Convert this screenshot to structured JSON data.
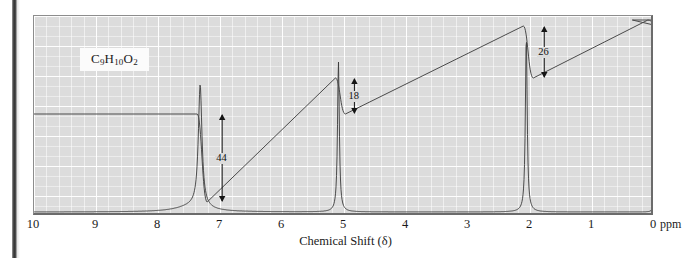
{
  "figure": {
    "formula": "C9H10O2",
    "formula_parts": [
      {
        "t": "C",
        "sub": false
      },
      {
        "t": "9",
        "sub": true
      },
      {
        "t": "H",
        "sub": false
      },
      {
        "t": "10",
        "sub": true
      },
      {
        "t": "O",
        "sub": false
      },
      {
        "t": "2",
        "sub": true
      }
    ],
    "axis_title": "Chemical Shift (δ)",
    "axis_unit": "ppm"
  },
  "chart_data": {
    "type": "line",
    "title": "",
    "subtitle": "",
    "xlabel": "Chemical Shift (δ)",
    "ylabel": "",
    "xlim": [
      10,
      0
    ],
    "xlim_note": "axis decreases left to right",
    "ylim": [
      0,
      100
    ],
    "grid": true,
    "legend": "none",
    "tick_labels": [
      "10",
      "9",
      "8",
      "7",
      "6",
      "5",
      "4",
      "3",
      "2",
      "1",
      "0"
    ],
    "tick_values": [
      10,
      9,
      8,
      7,
      6,
      5,
      4,
      3,
      2,
      1,
      0
    ],
    "minor_ticks_per_major": 5,
    "peaks": [
      {
        "name": "aromatic-multiplet",
        "shift": 7.32,
        "height": 66,
        "width": 0.045,
        "integration": 44,
        "label": "44",
        "multiplicity": "multiplet"
      },
      {
        "name": "methylene-singlet",
        "shift": 5.09,
        "height": 81,
        "width": 0.022,
        "integration": 18,
        "label": "18",
        "multiplicity": "singlet"
      },
      {
        "name": "methyl-singlet",
        "shift": 2.06,
        "height": 95,
        "width": 0.022,
        "integration": 26,
        "label": "26",
        "multiplicity": "singlet"
      },
      {
        "name": "tms-reference",
        "shift": 0.0,
        "height": 13,
        "width": 0.016,
        "integration": 0,
        "label": "",
        "multiplicity": "singlet"
      }
    ],
    "integration_steps": [
      {
        "name": "step-aromatic",
        "shift": 7.32,
        "value": 44,
        "label": "44",
        "baseline_pct": 93,
        "top_pct": 49
      },
      {
        "name": "step-methylene",
        "shift": 5.09,
        "value": 18,
        "label": "18",
        "baseline_pct": 49,
        "top_pct": 31
      },
      {
        "name": "step-methyl",
        "shift": 2.06,
        "value": 26,
        "label": "26",
        "baseline_pct": 31,
        "top_pct": 5
      },
      {
        "name": "step-tms",
        "shift": 0.05,
        "value": 0,
        "label": "",
        "baseline_pct": 5,
        "top_pct": 2
      }
    ],
    "colors": {
      "plot_background": "#dcdcdc",
      "grid_line": "#ffffff",
      "trace": "#3a3a3a",
      "integration_trace": "#4a4a4a",
      "frame": "#6b6b6b",
      "text": "#1a1a1a"
    }
  }
}
